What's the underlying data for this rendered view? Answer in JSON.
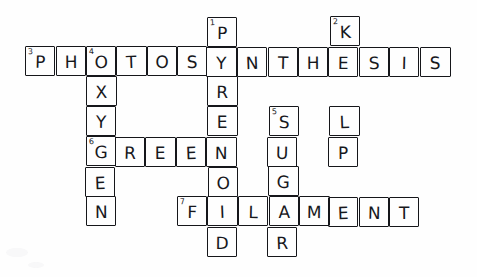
{
  "document": {
    "kind": "hand-drawn crossword puzzle grid",
    "title": "Photosynthesis Crossword",
    "background_color": "#fefefe",
    "ink_color": "#17181c"
  },
  "grid": {
    "origin_x": 25,
    "origin_y": 17,
    "cell_width": 30.4,
    "cell_height": 30,
    "columns": 14,
    "rows": 8
  },
  "entries": [
    {
      "number": "1",
      "direction": "down",
      "answer": "PYRENOID",
      "row": 0,
      "col": 6
    },
    {
      "number": "2",
      "direction": "down",
      "answer": "KELP",
      "row": 0,
      "col": 10
    },
    {
      "number": "3",
      "direction": "across",
      "answer": "PHOTOSYNTHESIS",
      "row": 1,
      "col": 0
    },
    {
      "number": "4",
      "direction": "down",
      "answer": "OXYGEN",
      "row": 1,
      "col": 2
    },
    {
      "number": "5",
      "direction": "down",
      "answer": "SUGAR",
      "row": 3,
      "col": 8
    },
    {
      "number": "6",
      "direction": "across",
      "answer": "GREEN",
      "row": 4,
      "col": 2
    },
    {
      "number": "7",
      "direction": "across",
      "answer": "FILAMENT",
      "row": 6,
      "col": 5
    }
  ],
  "cells": [
    {
      "row": 0,
      "col": 6,
      "letter": "P",
      "number": "1",
      "tilt": "tilt-c"
    },
    {
      "row": 0,
      "col": 10,
      "letter": "K",
      "number": "2",
      "tilt": "tilt-b"
    },
    {
      "row": 1,
      "col": 0,
      "letter": "P",
      "number": "3",
      "tilt": "tilt-a"
    },
    {
      "row": 1,
      "col": 1,
      "letter": "H",
      "number": "",
      "tilt": "tilt-d"
    },
    {
      "row": 1,
      "col": 2,
      "letter": "O",
      "number": "4",
      "tilt": "tilt-c"
    },
    {
      "row": 1,
      "col": 3,
      "letter": "T",
      "number": "",
      "tilt": "tilt-b"
    },
    {
      "row": 1,
      "col": 4,
      "letter": "O",
      "number": "",
      "tilt": "tilt-a"
    },
    {
      "row": 1,
      "col": 5,
      "letter": "S",
      "number": "",
      "tilt": "tilt-d"
    },
    {
      "row": 1,
      "col": 6,
      "letter": "Y",
      "number": "",
      "tilt": "tilt-c"
    },
    {
      "row": 1,
      "col": 7,
      "letter": "N",
      "number": "",
      "tilt": "tilt-b"
    },
    {
      "row": 1,
      "col": 8,
      "letter": "T",
      "number": "",
      "tilt": "tilt-a"
    },
    {
      "row": 1,
      "col": 9,
      "letter": "H",
      "number": "",
      "tilt": "tilt-d"
    },
    {
      "row": 1,
      "col": 10,
      "letter": "E",
      "number": "",
      "tilt": "tilt-c"
    },
    {
      "row": 1,
      "col": 11,
      "letter": "S",
      "number": "",
      "tilt": "tilt-b"
    },
    {
      "row": 1,
      "col": 12,
      "letter": "I",
      "number": "",
      "tilt": "tilt-a"
    },
    {
      "row": 1,
      "col": 13,
      "letter": "S",
      "number": "",
      "tilt": "tilt-d"
    },
    {
      "row": 2,
      "col": 2,
      "letter": "X",
      "number": "",
      "tilt": "tilt-b"
    },
    {
      "row": 2,
      "col": 6,
      "letter": "R",
      "number": "",
      "tilt": "tilt-c"
    },
    {
      "row": 3,
      "col": 2,
      "letter": "Y",
      "number": "",
      "tilt": "tilt-a"
    },
    {
      "row": 3,
      "col": 6,
      "letter": "E",
      "number": "",
      "tilt": "tilt-d"
    },
    {
      "row": 3,
      "col": 8,
      "letter": "S",
      "number": "5",
      "tilt": "tilt-c"
    },
    {
      "row": 3,
      "col": 10,
      "letter": "L",
      "number": "",
      "tilt": "tilt-b"
    },
    {
      "row": 4,
      "col": 2,
      "letter": "G",
      "number": "6",
      "tilt": "tilt-c"
    },
    {
      "row": 4,
      "col": 3,
      "letter": "R",
      "number": "",
      "tilt": "tilt-a"
    },
    {
      "row": 4,
      "col": 4,
      "letter": "E",
      "number": "",
      "tilt": "tilt-d"
    },
    {
      "row": 4,
      "col": 5,
      "letter": "E",
      "number": "",
      "tilt": "tilt-b"
    },
    {
      "row": 4,
      "col": 6,
      "letter": "N",
      "number": "",
      "tilt": "tilt-c"
    },
    {
      "row": 4,
      "col": 8,
      "letter": "U",
      "number": "",
      "tilt": "tilt-a"
    },
    {
      "row": 4,
      "col": 10,
      "letter": "P",
      "number": "",
      "tilt": "tilt-d"
    },
    {
      "row": 5,
      "col": 2,
      "letter": "E",
      "number": "",
      "tilt": "tilt-b"
    },
    {
      "row": 5,
      "col": 6,
      "letter": "O",
      "number": "",
      "tilt": "tilt-c"
    },
    {
      "row": 5,
      "col": 8,
      "letter": "G",
      "number": "",
      "tilt": "tilt-a"
    },
    {
      "row": 6,
      "col": 2,
      "letter": "N",
      "number": "",
      "tilt": "tilt-d"
    },
    {
      "row": 6,
      "col": 5,
      "letter": "F",
      "number": "7",
      "tilt": "tilt-c"
    },
    {
      "row": 6,
      "col": 6,
      "letter": "I",
      "number": "",
      "tilt": "tilt-b"
    },
    {
      "row": 6,
      "col": 7,
      "letter": "L",
      "number": "",
      "tilt": "tilt-a"
    },
    {
      "row": 6,
      "col": 8,
      "letter": "A",
      "number": "",
      "tilt": "tilt-d"
    },
    {
      "row": 6,
      "col": 9,
      "letter": "M",
      "number": "",
      "tilt": "tilt-c"
    },
    {
      "row": 6,
      "col": 10,
      "letter": "E",
      "number": "",
      "tilt": "tilt-b"
    },
    {
      "row": 6,
      "col": 11,
      "letter": "N",
      "number": "",
      "tilt": "tilt-a"
    },
    {
      "row": 6,
      "col": 12,
      "letter": "T",
      "number": "",
      "tilt": "tilt-d"
    },
    {
      "row": 7,
      "col": 6,
      "letter": "D",
      "number": "",
      "tilt": "tilt-c"
    },
    {
      "row": 7,
      "col": 8,
      "letter": "R",
      "number": "",
      "tilt": "tilt-b"
    }
  ]
}
